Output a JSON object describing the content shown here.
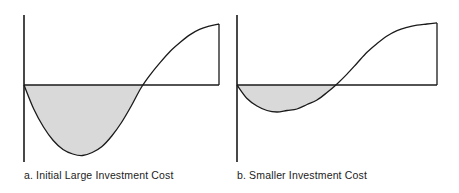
{
  "figure": {
    "background_color": "#ffffff",
    "line_color": "#1a1a1a",
    "fill_color": "#d9d9d9",
    "panels": [
      {
        "id": "a",
        "caption": "a. Initial Large Investment Cost"
      },
      {
        "id": "b",
        "caption": "b. Smaller Investment Cost"
      }
    ]
  },
  "chart_data": [
    {
      "type": "area",
      "title": "a. Initial Large Investment Cost",
      "subtitle": "",
      "xlabel": "",
      "ylabel": "",
      "grid": false,
      "legend": null,
      "axes": {
        "x_axis_at_y": 0,
        "y_axis_at_x": 0,
        "xlim": [
          0,
          100
        ],
        "ylim": [
          -48,
          56
        ]
      },
      "annotations": [
        "shaded region = cumulative negative cash flow (investment cost)"
      ],
      "x": [
        0,
        5,
        10,
        15,
        20,
        25,
        30,
        35,
        40,
        45,
        50,
        55,
        60,
        65,
        70,
        75,
        80,
        85,
        90,
        95,
        100
      ],
      "values": [
        0,
        -16,
        -28,
        -37,
        -43,
        -46,
        -47,
        -45,
        -41,
        -34,
        -25,
        -14,
        -2,
        10,
        21,
        31,
        39,
        46,
        51,
        54,
        56
      ],
      "fill_below_zero": true,
      "closing_vertical_at_x": 100
    },
    {
      "type": "area",
      "title": "b. Smaller Investment Cost",
      "subtitle": "",
      "xlabel": "",
      "ylabel": "",
      "grid": false,
      "legend": null,
      "axes": {
        "x_axis_at_y": 0,
        "y_axis_at_x": 0,
        "xlim": [
          0,
          100
        ],
        "ylim": [
          -18,
          56
        ]
      },
      "annotations": [
        "shaded region = cumulative negative cash flow (smaller investment cost)"
      ],
      "x": [
        0,
        5,
        10,
        15,
        20,
        25,
        30,
        35,
        40,
        45,
        50,
        55,
        60,
        65,
        70,
        75,
        80,
        85,
        90,
        95,
        100
      ],
      "values": [
        0,
        -9,
        -14,
        -17,
        -18,
        -17,
        -16,
        -13,
        -10,
        -5,
        1,
        10,
        20,
        30,
        38,
        45,
        50,
        53,
        55,
        56,
        57
      ],
      "fill_below_zero": true,
      "closing_vertical_at_x": 100
    }
  ]
}
